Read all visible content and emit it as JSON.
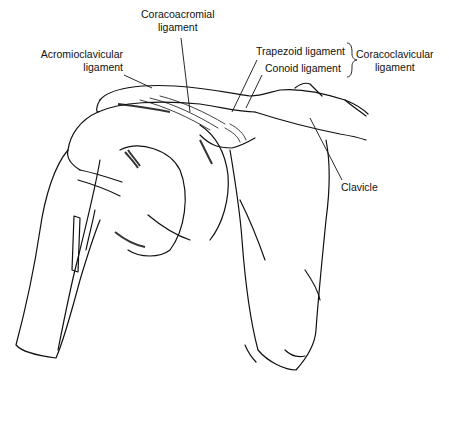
{
  "figure": {
    "colors": {
      "ink": "#111111",
      "background": "#ffffff"
    }
  },
  "labels": {
    "coracoacromial": {
      "line1": "Coracoacromial",
      "line2": "ligament"
    },
    "acromioclavicular": {
      "line1": "Acromioclavicular",
      "line2": "ligament"
    },
    "trapezoid": {
      "text": "Trapezoid ligament"
    },
    "conoid": {
      "text": "Conoid ligament"
    },
    "coracoclavicular": {
      "line1": "Coracoclavicular",
      "line2": "ligament"
    },
    "clavicle": {
      "text": "Clavicle"
    }
  }
}
